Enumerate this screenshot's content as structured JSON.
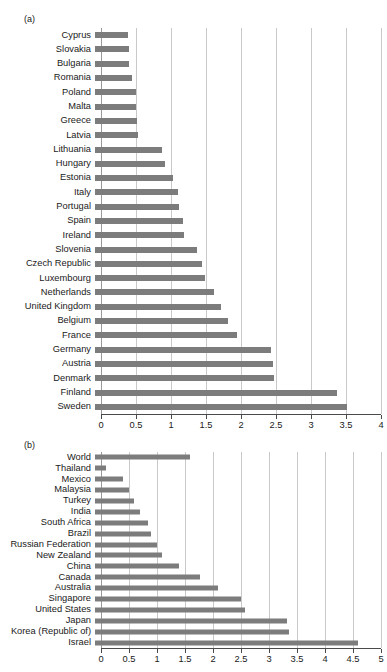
{
  "running_head": "",
  "panels": [
    {
      "tag": "(a)",
      "name": "panel-a"
    },
    {
      "tag": "(b)",
      "name": "panel-b"
    }
  ],
  "chart_data": [
    {
      "type": "bar",
      "orientation": "horizontal",
      "panel": "(a)",
      "title": "",
      "xlabel": "",
      "ylabel": "",
      "xlim": [
        0,
        4
      ],
      "grid": true,
      "legend": "none",
      "xticks": [
        0,
        0.5,
        1,
        1.5,
        2,
        2.5,
        3,
        3.5,
        4
      ],
      "xticklabels": [
        "0",
        "0.5",
        "1",
        "1.5",
        "2",
        "2.5",
        "3",
        "3.5",
        "4"
      ],
      "bar_color": "#7c7c7c",
      "categories": [
        "Cyprus",
        "Slovakia",
        "Bulgaria",
        "Romania",
        "Poland",
        "Malta",
        "Greece",
        "Latvia",
        "Lithuania",
        "Hungary",
        "Estonia",
        "Italy",
        "Portugal",
        "Spain",
        "Ireland",
        "Slovenia",
        "Czech Republic",
        "Luxembourg",
        "Netherlands",
        "United Kingdom",
        "Belgium",
        "France",
        "Germany",
        "Austria",
        "Denmark",
        "Finland",
        "Sweden"
      ],
      "values": [
        0.47,
        0.48,
        0.49,
        0.53,
        0.58,
        0.59,
        0.6,
        0.61,
        0.95,
        1.0,
        1.12,
        1.18,
        1.2,
        1.25,
        1.27,
        1.45,
        1.53,
        1.57,
        1.7,
        1.8,
        1.9,
        2.03,
        2.52,
        2.54,
        2.55,
        3.45,
        3.6
      ]
    },
    {
      "type": "bar",
      "orientation": "horizontal",
      "panel": "(b)",
      "title": "",
      "xlabel": "",
      "ylabel": "",
      "xlim": [
        0,
        5
      ],
      "grid": true,
      "legend": "none",
      "xticks": [
        0,
        0.5,
        1,
        1.5,
        2,
        2.5,
        3,
        3.5,
        4,
        4.5,
        5
      ],
      "xticklabels": [
        "0",
        "0.5",
        "1",
        "1.5",
        "2",
        "2.5",
        "3",
        "3.5",
        "4",
        "4.5",
        "5"
      ],
      "bar_color": "#7c7c7c",
      "categories": [
        "World",
        "Thailand",
        "Mexico",
        "Malaysia",
        "Turkey",
        "India",
        "South Africa",
        "Brazil",
        "Russian Federation",
        "New Zealand",
        "China",
        "Canada",
        "Australia",
        "Singapore",
        "United States",
        "Japan",
        "Korea (Republic of)",
        "Israel"
      ],
      "values": [
        1.7,
        0.2,
        0.5,
        0.6,
        0.7,
        0.8,
        0.95,
        1.0,
        1.1,
        1.2,
        1.5,
        1.88,
        2.2,
        2.6,
        2.68,
        3.42,
        3.46,
        4.7
      ]
    }
  ]
}
